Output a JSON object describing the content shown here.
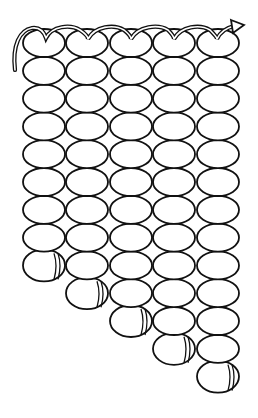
{
  "figure": {
    "type": "line-art",
    "colors": {
      "line": "#111111",
      "fill": "#ffffff",
      "background": "#ffffff"
    },
    "columns": [
      {
        "id": 1,
        "cx": 44,
        "bead_count": 9
      },
      {
        "id": 2,
        "cx": 87,
        "bead_count": 10
      },
      {
        "id": 3,
        "cx": 131,
        "bead_count": 11
      },
      {
        "id": 4,
        "cx": 174,
        "bead_count": 12
      },
      {
        "id": 5,
        "cx": 218,
        "bead_count": 13
      }
    ],
    "bead": {
      "rx": 21,
      "ry": 14,
      "first_cy": 43,
      "pitch_y": 27.8
    },
    "thread": {
      "start": "left-tail",
      "end": "right-arrow"
    }
  }
}
